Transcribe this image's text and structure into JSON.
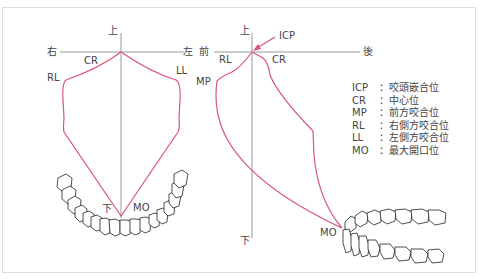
{
  "colors": {
    "path": "#d9557a",
    "axis": "#999999",
    "text": "#444444",
    "frame": "#d6e0e6"
  },
  "frontal_view": {
    "axis_labels": {
      "up": "上",
      "down": "下",
      "right": "右",
      "left": "左"
    },
    "points": {
      "CR": "CR",
      "RL": "RL",
      "LL": "LL",
      "MO": "MO"
    }
  },
  "sagittal_view": {
    "axis_labels": {
      "up": "上",
      "down": "下",
      "front": "前",
      "back": "後"
    },
    "points": {
      "ICP": "ICP",
      "RL": "RL",
      "CR": "CR",
      "MP": "MP",
      "MO": "MO"
    }
  },
  "legend": [
    {
      "abbr": "ICP",
      "sep": "：",
      "desc": "咬頭嵌合位"
    },
    {
      "abbr": "CR",
      "sep": "：",
      "desc": "中心位"
    },
    {
      "abbr": "MP",
      "sep": "：",
      "desc": "前方咬合位"
    },
    {
      "abbr": "RL",
      "sep": "：",
      "desc": "右側方咬合位"
    },
    {
      "abbr": "LL",
      "sep": "：",
      "desc": "左側方咬合位"
    },
    {
      "abbr": "MO",
      "sep": "：",
      "desc": "最大開口位"
    }
  ]
}
